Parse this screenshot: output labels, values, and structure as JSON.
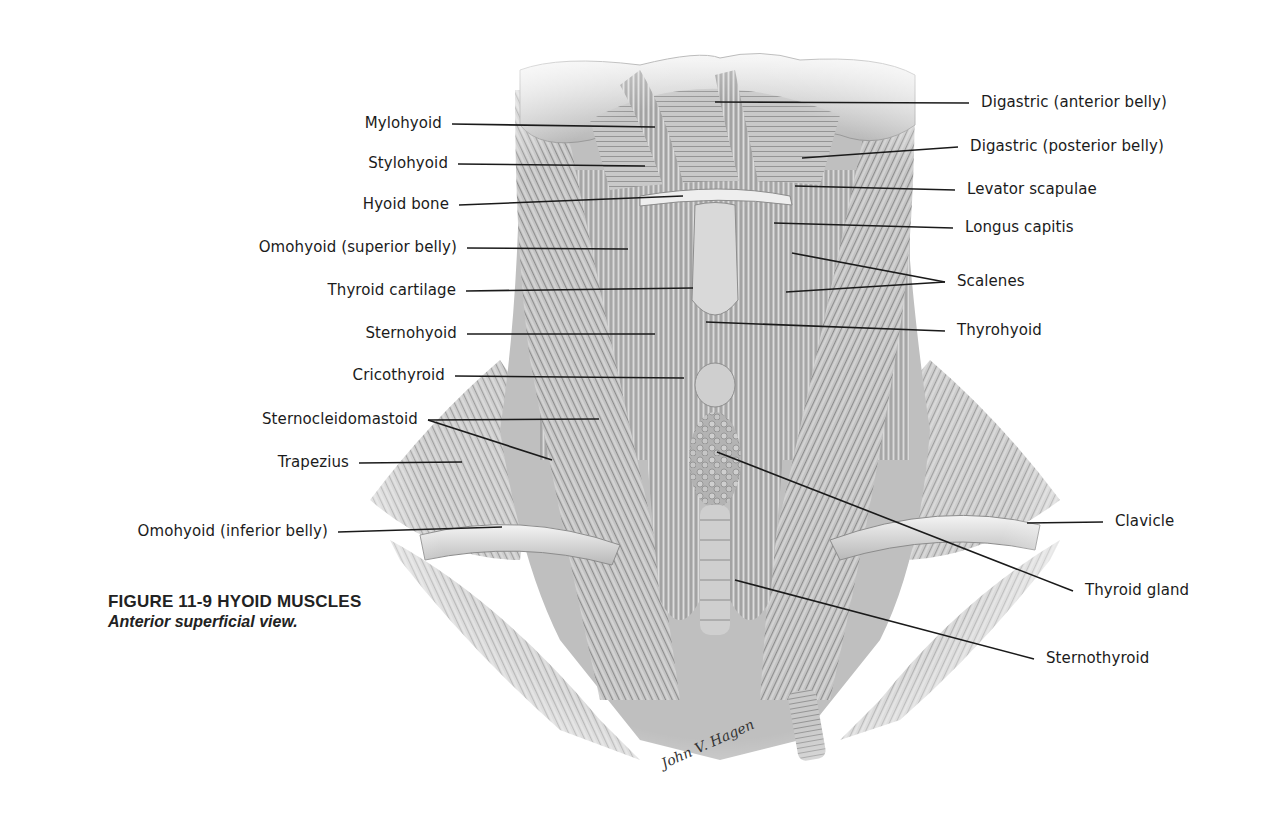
{
  "figure": {
    "number": "11-9",
    "caption_title": "FIGURE 11-9 HYOID MUSCLES",
    "caption_subtitle": "Anterior superficial view.",
    "signature": "John V. Hagen"
  },
  "labels_left": [
    {
      "id": "mylohyoid",
      "text": "Mylohyoid",
      "x": 452,
      "y": 114,
      "tx": 655,
      "ty": 127
    },
    {
      "id": "stylohyoid",
      "text": "Stylohyoid",
      "x": 458,
      "y": 154,
      "tx": 645,
      "ty": 166
    },
    {
      "id": "hyoid-bone",
      "text": "Hyoid bone",
      "x": 459,
      "y": 195,
      "tx": 683,
      "ty": 196
    },
    {
      "id": "omohyoid-superior",
      "text": "Omohyoid (superior belly)",
      "x": 467,
      "y": 238,
      "tx": 628,
      "ty": 249
    },
    {
      "id": "thyroid-cartilage",
      "text": "Thyroid cartilage",
      "x": 466,
      "y": 281,
      "tx": 693,
      "ty": 288
    },
    {
      "id": "sternohyoid",
      "text": "Sternohyoid",
      "x": 467,
      "y": 324,
      "tx": 655,
      "ty": 334
    },
    {
      "id": "cricothyroid",
      "text": "Cricothyroid",
      "x": 455,
      "y": 366,
      "tx": 684,
      "ty": 378
    },
    {
      "id": "sternocleidomastoid",
      "text": "Sternocleidomastoid",
      "x": 428,
      "y": 410,
      "tx": 599,
      "ty": 419,
      "tx2": 552,
      "ty2": 460
    },
    {
      "id": "trapezius",
      "text": "Trapezius",
      "x": 359,
      "y": 453,
      "tx": 462,
      "ty": 462
    },
    {
      "id": "omohyoid-inferior",
      "text": "Omohyoid (inferior belly)",
      "x": 338,
      "y": 522,
      "tx": 502,
      "ty": 527
    }
  ],
  "labels_right": [
    {
      "id": "digastric-anterior",
      "text": "Digastric (anterior belly)",
      "x": 981,
      "y": 93,
      "tx": 715,
      "ty": 102
    },
    {
      "id": "digastric-posterior",
      "text": "Digastric (posterior belly)",
      "x": 970,
      "y": 137,
      "tx": 802,
      "ty": 158
    },
    {
      "id": "levator-scapulae",
      "text": "Levator scapulae",
      "x": 967,
      "y": 180,
      "tx": 795,
      "ty": 186
    },
    {
      "id": "longus-capitis",
      "text": "Longus capitis",
      "x": 965,
      "y": 218,
      "tx": 774,
      "ty": 223
    },
    {
      "id": "scalenes",
      "text": "Scalenes",
      "x": 957,
      "y": 272,
      "tx": 792,
      "ty": 253,
      "tx2": 786,
      "ty2": 292
    },
    {
      "id": "thyrohyoid",
      "text": "Thyrohyoid",
      "x": 957,
      "y": 321,
      "tx": 706,
      "ty": 322
    },
    {
      "id": "clavicle",
      "text": "Clavicle",
      "x": 1115,
      "y": 512,
      "tx": 1027,
      "ty": 523
    },
    {
      "id": "thyroid-gland",
      "text": "Thyroid gland",
      "x": 1085,
      "y": 581,
      "tx": 717,
      "ty": 452
    },
    {
      "id": "sternothyroid",
      "text": "Sternothyroid",
      "x": 1046,
      "y": 649,
      "tx": 735,
      "ty": 580
    }
  ],
  "colors": {
    "background": "#ffffff",
    "label_text": "#1b1b1b",
    "leader_line": "#1a1a1a",
    "muscle_light": "#d8d8d8",
    "muscle_mid": "#a9a9a9",
    "muscle_dark": "#6e6e6e"
  }
}
